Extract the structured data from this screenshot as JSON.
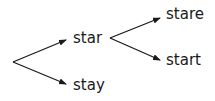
{
  "tree": {
    "root": "",
    "nodes": [
      {
        "id": "star",
        "label": "star",
        "parent": "root"
      },
      {
        "id": "stay",
        "label": "stay",
        "parent": "root"
      },
      {
        "id": "stare",
        "label": "stare",
        "parent": "star"
      },
      {
        "id": "start",
        "label": "start",
        "parent": "star"
      }
    ]
  },
  "labels": {
    "star": "star",
    "stay": "stay",
    "stare": "stare",
    "start": "start"
  },
  "colors": {
    "line": "#1a1a1a",
    "text": "#1a1a1a",
    "background": "#ffffff"
  }
}
